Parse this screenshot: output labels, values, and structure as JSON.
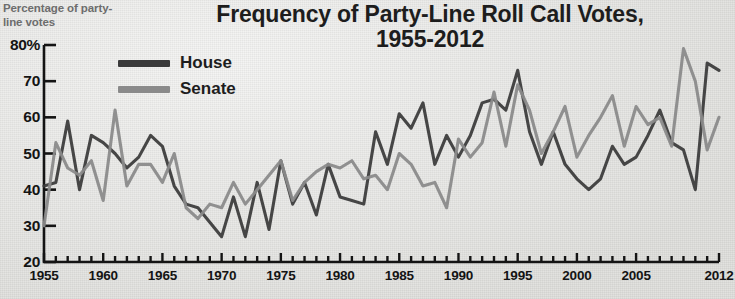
{
  "title": {
    "line1": "Frequency of Party-Line Roll Call Votes,",
    "line2": "1955-2012"
  },
  "axis_caption": "Percentage of party-line votes",
  "legend": {
    "items": [
      {
        "label": "House",
        "color": "#3b3b3b"
      },
      {
        "label": "Senate",
        "color": "#8a8a8a"
      }
    ]
  },
  "colors": {
    "house": "#3b3b3b",
    "senate": "#8a8a8a",
    "axis": "#141414",
    "background": "#e9e9e6",
    "caption": "#6d6d6d"
  },
  "chart_data": {
    "type": "line",
    "title": "Frequency of Party-Line Roll Call Votes, 1955-2012",
    "xlabel": "",
    "ylabel": "Percentage of party-line votes",
    "xlim": [
      1955,
      2012
    ],
    "ylim": [
      20,
      80
    ],
    "yticks": [
      20,
      30,
      40,
      50,
      60,
      70,
      80
    ],
    "ytick_labels": [
      "20",
      "30",
      "40",
      "50",
      "60",
      "70",
      "80%"
    ],
    "xticks": [
      1955,
      1960,
      1965,
      1970,
      1975,
      1980,
      1985,
      1990,
      1995,
      2000,
      2005,
      2012
    ],
    "xtick_labels": [
      "1955",
      "1960",
      "1965",
      "1970",
      "1975",
      "1980",
      "1985",
      "1990",
      "1995",
      "2000",
      "2005",
      "2012"
    ],
    "minor_xticks_every": 1,
    "grid": false,
    "legend_position": "upper-left-inside",
    "x": [
      1955,
      1956,
      1957,
      1958,
      1959,
      1960,
      1961,
      1962,
      1963,
      1964,
      1965,
      1966,
      1967,
      1968,
      1969,
      1970,
      1971,
      1972,
      1973,
      1974,
      1975,
      1976,
      1977,
      1978,
      1979,
      1980,
      1981,
      1982,
      1983,
      1984,
      1985,
      1986,
      1987,
      1988,
      1989,
      1990,
      1991,
      1992,
      1993,
      1994,
      1995,
      1996,
      1997,
      1998,
      1999,
      2000,
      2001,
      2002,
      2003,
      2004,
      2005,
      2006,
      2007,
      2008,
      2009,
      2010,
      2011,
      2012
    ],
    "series": [
      {
        "name": "House",
        "color": "#3b3b3b",
        "values": [
          41,
          42,
          59,
          40,
          55,
          53,
          50,
          46,
          49,
          55,
          52,
          41,
          36,
          35,
          31,
          27,
          38,
          27,
          42,
          29,
          48,
          36,
          42,
          33,
          47,
          38,
          37,
          36,
          56,
          47,
          61,
          57,
          64,
          47,
          55,
          49,
          55,
          64,
          65,
          62,
          73,
          56,
          47,
          56,
          47,
          43,
          40,
          43,
          52,
          47,
          49,
          55,
          62,
          53,
          51,
          40,
          75,
          73
        ]
      },
      {
        "name": "Senate",
        "color": "#8a8a8a",
        "values": [
          30,
          53,
          46,
          44,
          48,
          37,
          62,
          41,
          47,
          47,
          42,
          50,
          35,
          32,
          36,
          35,
          42,
          36,
          40,
          44,
          48,
          37,
          42,
          45,
          47,
          46,
          48,
          43,
          44,
          40,
          50,
          47,
          41,
          42,
          35,
          54,
          49,
          53,
          67,
          52,
          69,
          62,
          50,
          56,
          63,
          49,
          55,
          60,
          66,
          52,
          63,
          58,
          60,
          52,
          79,
          70,
          51,
          60
        ]
      }
    ]
  }
}
